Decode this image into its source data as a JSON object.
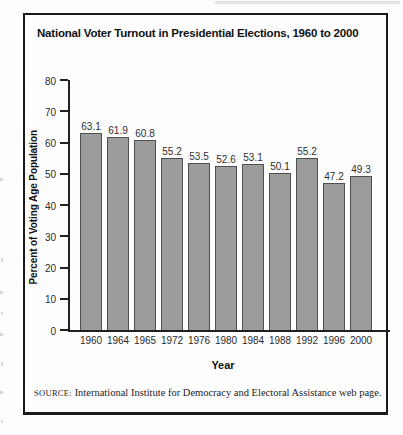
{
  "figure": {
    "title": "National Voter Turnout in Presidential Elections, 1960 to 2000",
    "source": {
      "label": "SOURCE:",
      "text": "International Institute for Democracy and Electoral Assistance web page."
    }
  },
  "chart_data": {
    "type": "bar",
    "title": "National Voter Turnout in Presidential Elections, 1960 to 2000",
    "categories": [
      "1960",
      "1964",
      "1965",
      "1972",
      "1976",
      "1980",
      "1984",
      "1988",
      "1992",
      "1996",
      "2000"
    ],
    "values": [
      63.1,
      61.9,
      60.8,
      55.2,
      53.5,
      52.6,
      53.1,
      50.1,
      55.2,
      47.2,
      49.3
    ],
    "data_labels": [
      "63.1",
      "61.9",
      "60.8",
      "55.2",
      "53.5",
      "52.6",
      "53.1",
      "50.1",
      "55.2",
      "47.2",
      "49.3"
    ],
    "xlabel": "Year",
    "ylabel": "Percent of Voting Age Population",
    "ylim": [
      0,
      80
    ],
    "yticks": [
      0,
      10,
      20,
      30,
      40,
      50,
      60,
      70,
      80
    ],
    "grid": false,
    "legend": "none",
    "colors": {
      "bar_fill": "#9c9c9c",
      "bar_border": "#4f4f4f",
      "axis": "#1f1f1f",
      "text": "#111111"
    }
  }
}
